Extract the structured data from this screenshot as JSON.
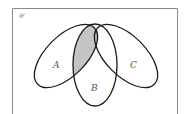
{
  "diagram": {
    "type": "venn",
    "universe_label": "𝒰",
    "sets": [
      {
        "name": "A",
        "label": "A"
      },
      {
        "name": "B",
        "label": "B"
      },
      {
        "name": "C",
        "label": "C"
      }
    ],
    "shaded_region": "A ∩ B",
    "colors": {
      "outline": "#1a1a1a",
      "frame": "#8a8a8a",
      "shading": "#c4c4c4",
      "label": "#555555"
    }
  }
}
